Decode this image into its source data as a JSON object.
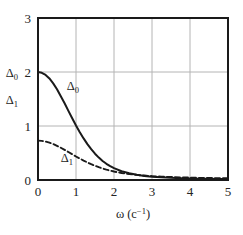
{
  "chart_data": {
    "type": "line",
    "title": "",
    "xlabel": "ω (c⁻¹)",
    "ylabel": "",
    "xlim": [
      0,
      5
    ],
    "ylim": [
      0,
      3
    ],
    "xticks": [
      "0",
      "1",
      "2",
      "3",
      "4",
      "5"
    ],
    "yticks": [
      "0",
      "1",
      "2",
      "3"
    ],
    "xtick_values": [
      0,
      1,
      2,
      3,
      4,
      5
    ],
    "ytick_values": [
      0,
      1,
      2,
      3
    ],
    "grid": true,
    "grid_color": "#b4b4b4",
    "axis_color": "#1a1a1a",
    "legend": "inline-labels",
    "axis_quantity_labels": [
      {
        "text": "Δ",
        "subscript": "0",
        "at_value": 2.0
      },
      {
        "text": "Δ",
        "subscript": "1",
        "at_value": 1.5
      }
    ],
    "annotations": [
      {
        "text": "Δ",
        "subscript": "0",
        "x": 0.92,
        "y": 1.66
      },
      {
        "text": "Δ",
        "subscript": "1",
        "x": 0.76,
        "y": 0.34
      }
    ],
    "series": [
      {
        "name": "Δ₀",
        "style": "solid",
        "color": "#1a1a1a",
        "width": 2.0,
        "x": [
          0,
          0.1,
          0.2,
          0.3,
          0.4,
          0.5,
          0.6,
          0.7,
          0.8,
          0.9,
          1.0,
          1.1,
          1.2,
          1.3,
          1.4,
          1.5,
          1.6,
          1.7,
          1.8,
          1.9,
          2.0,
          2.2,
          2.4,
          2.6,
          2.8,
          3.0,
          3.25,
          3.5,
          3.75,
          4.0,
          4.25,
          4.5,
          4.75,
          5.0
        ],
        "values": [
          2.0,
          1.985,
          1.945,
          1.88,
          1.79,
          1.68,
          1.55,
          1.42,
          1.28,
          1.145,
          1.01,
          0.885,
          0.77,
          0.665,
          0.57,
          0.487,
          0.415,
          0.353,
          0.3,
          0.256,
          0.219,
          0.163,
          0.124,
          0.096,
          0.076,
          0.062,
          0.049,
          0.04,
          0.034,
          0.029,
          0.025,
          0.022,
          0.02,
          0.018
        ]
      },
      {
        "name": "Δ₁",
        "style": "dashed",
        "color": "#1a1a1a",
        "width": 1.9,
        "dash": "5,3",
        "x": [
          0,
          0.1,
          0.2,
          0.3,
          0.4,
          0.5,
          0.6,
          0.7,
          0.8,
          0.9,
          1.0,
          1.1,
          1.2,
          1.3,
          1.4,
          1.5,
          1.6,
          1.7,
          1.8,
          1.9,
          2.0,
          2.2,
          2.4,
          2.6,
          2.8,
          3.0,
          3.25,
          3.5,
          3.75,
          4.0,
          4.25,
          4.5,
          4.75,
          5.0
        ],
        "values": [
          0.73,
          0.725,
          0.712,
          0.692,
          0.665,
          0.633,
          0.597,
          0.558,
          0.518,
          0.477,
          0.436,
          0.397,
          0.36,
          0.325,
          0.293,
          0.264,
          0.237,
          0.213,
          0.192,
          0.173,
          0.157,
          0.13,
          0.11,
          0.094,
          0.082,
          0.072,
          0.062,
          0.055,
          0.049,
          0.044,
          0.04,
          0.037,
          0.034,
          0.032
        ]
      }
    ]
  },
  "figure": {
    "background": "#ffffff"
  }
}
